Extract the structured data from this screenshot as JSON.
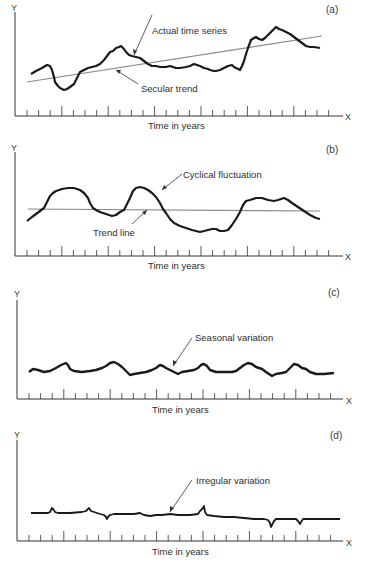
{
  "figure": {
    "panels": [
      {
        "id": "a",
        "tag": "(a)",
        "y_axis": "Y",
        "x_axis": "X",
        "xlabel": "Time in years",
        "annotations": [
          "Actual time series",
          "Secular trend"
        ]
      },
      {
        "id": "b",
        "tag": "(b)",
        "y_axis": "Y",
        "x_axis": "X",
        "xlabel": "Time in years",
        "annotations": [
          "Cyclical fluctuation",
          "Trend line"
        ]
      },
      {
        "id": "c",
        "tag": "(c)",
        "y_axis": "Y",
        "x_axis": "X",
        "xlabel": "Time in years",
        "annotations": [
          "Seasonal variation"
        ]
      },
      {
        "id": "d",
        "tag": "(d)",
        "y_axis": "Y",
        "x_axis": "X",
        "xlabel": "Time in years",
        "annotations": [
          "Irregular variation"
        ]
      }
    ],
    "colors": {
      "series": "#1a1a1a",
      "trend": "#8a8a8a",
      "axis": "#333333"
    }
  },
  "chart_data": [
    {
      "type": "line",
      "title": "(a)",
      "xlabel": "Time in years",
      "ylabel": "Y",
      "grid": false,
      "x_ticks": 27,
      "series": [
        {
          "name": "Actual time series",
          "points_px": [
            [
              31,
              74
            ],
            [
              42,
              68
            ],
            [
              47,
              65
            ],
            [
              52,
              70
            ],
            [
              55,
              82
            ],
            [
              60,
              88
            ],
            [
              64,
              90
            ],
            [
              70,
              87
            ],
            [
              76,
              80
            ],
            [
              80,
              72
            ],
            [
              88,
              68
            ],
            [
              96,
              66
            ],
            [
              104,
              60
            ],
            [
              110,
              52
            ],
            [
              116,
              48
            ],
            [
              121,
              46
            ],
            [
              126,
              52
            ],
            [
              132,
              56
            ],
            [
              140,
              58
            ],
            [
              148,
              64
            ],
            [
              156,
              66
            ],
            [
              166,
              67
            ],
            [
              180,
              68
            ],
            [
              194,
              64
            ],
            [
              200,
              66
            ],
            [
              210,
              70
            ],
            [
              216,
              71
            ],
            [
              226,
              68
            ],
            [
              236,
              68
            ],
            [
              240,
              70
            ],
            [
              244,
              61
            ],
            [
              248,
              48
            ],
            [
              256,
              37
            ],
            [
              262,
              40
            ],
            [
              268,
              35
            ],
            [
              276,
              27
            ],
            [
              282,
              30
            ],
            [
              290,
              34
            ],
            [
              298,
              40
            ],
            [
              306,
              46
            ],
            [
              314,
              47
            ],
            [
              320,
              48
            ]
          ]
        },
        {
          "name": "Secular trend",
          "points_px": [
            [
              27,
              82
            ],
            [
              322,
              36
            ]
          ]
        }
      ]
    },
    {
      "type": "line",
      "title": "(b)",
      "xlabel": "Time in years",
      "ylabel": "Y",
      "grid": false,
      "x_ticks": 27,
      "series": [
        {
          "name": "Cyclical fluctuation",
          "points_px": [
            [
              27,
              221
            ],
            [
              36,
              214
            ],
            [
              44,
              208
            ],
            [
              50,
              196
            ],
            [
              56,
              191
            ],
            [
              68,
              188
            ],
            [
              80,
              190
            ],
            [
              90,
              198
            ],
            [
              96,
              210
            ],
            [
              102,
              214
            ],
            [
              112,
              216
            ],
            [
              118,
              216
            ],
            [
              124,
              210
            ],
            [
              130,
              206
            ],
            [
              134,
              194
            ],
            [
              140,
              187
            ],
            [
              148,
              188
            ],
            [
              156,
              195
            ],
            [
              162,
              204
            ],
            [
              166,
              213
            ],
            [
              172,
              224
            ],
            [
              180,
              230
            ],
            [
              192,
              234
            ],
            [
              200,
              234
            ],
            [
              210,
              232
            ],
            [
              218,
              233
            ],
            [
              226,
              230
            ],
            [
              234,
              218
            ],
            [
              244,
              202
            ],
            [
              256,
              198
            ],
            [
              268,
              201
            ],
            [
              276,
              201
            ],
            [
              286,
              198
            ],
            [
              292,
              205
            ],
            [
              302,
              212
            ],
            [
              312,
              219
            ],
            [
              320,
              221
            ]
          ]
        },
        {
          "name": "Trend line",
          "points_px": [
            [
              27,
              209
            ],
            [
              320,
              211
            ]
          ]
        }
      ]
    },
    {
      "type": "line",
      "title": "(c)",
      "xlabel": "Time in years",
      "ylabel": "Y",
      "grid": false,
      "x_ticks": 27,
      "series": [
        {
          "name": "Seasonal variation",
          "points_px": [
            [
              29,
              371
            ],
            [
              33,
              368
            ],
            [
              44,
              372
            ],
            [
              56,
              368
            ],
            [
              66,
              363
            ],
            [
              70,
              369
            ],
            [
              82,
              372
            ],
            [
              96,
              370
            ],
            [
              106,
              366
            ],
            [
              112,
              362
            ],
            [
              118,
              364
            ],
            [
              124,
              370
            ],
            [
              132,
              375
            ],
            [
              140,
              373
            ],
            [
              148,
              372
            ],
            [
              156,
              368
            ],
            [
              160,
              365
            ],
            [
              166,
              367
            ],
            [
              172,
              371
            ],
            [
              180,
              373
            ],
            [
              188,
              370
            ],
            [
              198,
              369
            ],
            [
              204,
              364
            ],
            [
              210,
              368
            ],
            [
              220,
              372
            ],
            [
              234,
              372
            ],
            [
              240,
              368
            ],
            [
              246,
              364
            ],
            [
              252,
              366
            ],
            [
              262,
              372
            ],
            [
              272,
              376
            ],
            [
              284,
              372
            ],
            [
              292,
              364
            ],
            [
              298,
              366
            ],
            [
              306,
              372
            ],
            [
              316,
              375
            ],
            [
              334,
              374
            ]
          ]
        }
      ]
    },
    {
      "type": "line",
      "title": "(d)",
      "xlabel": "Time in years",
      "ylabel": "Y",
      "grid": false,
      "x_ticks": 27,
      "series": [
        {
          "name": "Irregular variation",
          "points_px": [
            [
              31,
              513
            ],
            [
              50,
              513
            ],
            [
              53,
              508
            ],
            [
              56,
              513
            ],
            [
              84,
              513
            ],
            [
              89,
              509
            ],
            [
              92,
              514
            ],
            [
              105,
              516
            ],
            [
              108,
              519
            ],
            [
              112,
              515
            ],
            [
              140,
              514
            ],
            [
              150,
              516
            ],
            [
              162,
              515
            ],
            [
              200,
              515
            ],
            [
              204,
              509
            ],
            [
              206,
              516
            ],
            [
              240,
              518
            ],
            [
              268,
              520
            ],
            [
              271,
              527
            ],
            [
              274,
              521
            ],
            [
              296,
              520
            ],
            [
              300,
              525
            ],
            [
              303,
              519
            ],
            [
              340,
              519
            ]
          ]
        }
      ]
    }
  ]
}
